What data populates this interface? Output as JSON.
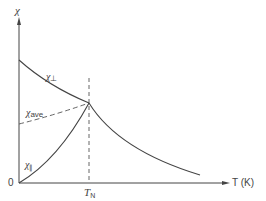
{
  "diagram": {
    "y_axis_label": "χ",
    "x_axis_label": "T (K)",
    "origin_label": "0",
    "neel_label_main": "T",
    "neel_label_sub": "N",
    "curves": {
      "perp": {
        "label_main": "χ",
        "label_sub": "⊥"
      },
      "ave": {
        "label_main": "χ",
        "label_sub": "ave"
      },
      "para": {
        "label_main": "χ",
        "label_sub": "∥"
      }
    },
    "colors": {
      "line": "#444444",
      "background": "#ffffff"
    }
  }
}
